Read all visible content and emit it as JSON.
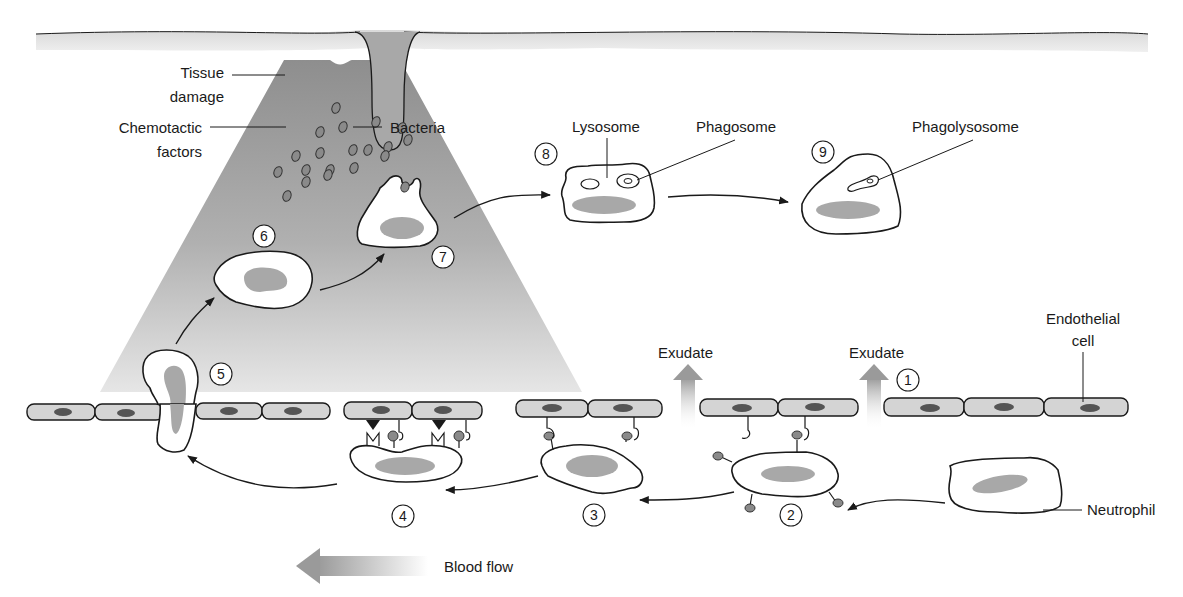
{
  "labels": {
    "tissue_damage_line1": "Tissue",
    "tissue_damage_line2": "damage",
    "chemotactic_line1": "Chemotactic",
    "chemotactic_line2": "factors",
    "bacteria": "Bacteria",
    "lysosome": "Lysosome",
    "phagosome": "Phagosome",
    "phagolysosome": "Phagolysosome",
    "exudate_1": "Exudate",
    "exudate_2": "Exudate",
    "endothelial_line1": "Endothelial",
    "endothelial_line2": "cell",
    "neutrophil": "Neutrophil",
    "blood_flow": "Blood flow"
  },
  "steps": [
    {
      "id": 1,
      "label": "1",
      "description": "Increased vascular permeability / exudate"
    },
    {
      "id": 2,
      "label": "2",
      "description": "Margination and rolling"
    },
    {
      "id": 3,
      "label": "3",
      "description": "Adhesion"
    },
    {
      "id": 4,
      "label": "4",
      "description": "Firm adhesion"
    },
    {
      "id": 5,
      "label": "5",
      "description": "Diapedesis / transmigration"
    },
    {
      "id": 6,
      "label": "6",
      "description": "Chemotaxis"
    },
    {
      "id": 7,
      "label": "7",
      "description": "Phagocytosis of bacteria"
    },
    {
      "id": 8,
      "label": "8",
      "description": "Phagosome and lysosome"
    },
    {
      "id": 9,
      "label": "9",
      "description": "Phagolysosome formation"
    }
  ],
  "colors": {
    "gradient_gray": "#9a9a9a",
    "endothelium_fill": "#d4d4d4",
    "nucleus": "#a8a8a8",
    "outline": "#1a1a1a"
  }
}
